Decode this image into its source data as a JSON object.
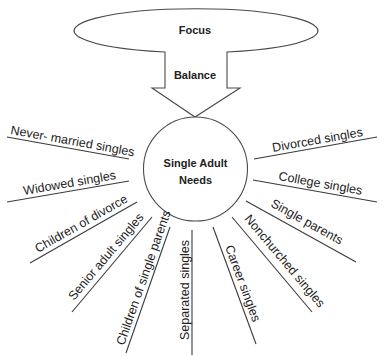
{
  "diagram": {
    "top_ellipse": {
      "label": "Focus"
    },
    "arrow": {
      "label": "Balance"
    },
    "center": {
      "line1": "Single Adult",
      "line2": "Needs"
    },
    "spokes": [
      {
        "id": "never-married",
        "label": "Never- married singles"
      },
      {
        "id": "widowed",
        "label": "Widowed singles"
      },
      {
        "id": "children-of-divorce",
        "label": "Children of divorce"
      },
      {
        "id": "senior-adult",
        "label": "Senior adult singles"
      },
      {
        "id": "children-of-single-parents",
        "label": "Children of single parents"
      },
      {
        "id": "separated",
        "label": "Separated singles"
      },
      {
        "id": "career",
        "label": "Career singles"
      },
      {
        "id": "nonchurched",
        "label": "Nonchurched singles"
      },
      {
        "id": "single-parents",
        "label": "Single parents"
      },
      {
        "id": "college",
        "label": "College singles"
      },
      {
        "id": "divorced",
        "label": "Divorced singles"
      }
    ]
  }
}
